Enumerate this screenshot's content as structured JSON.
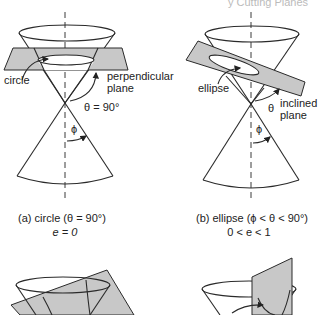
{
  "header": {
    "partial_title": "y Cutting Planes"
  },
  "panels": [
    {
      "id": "a",
      "labels": {
        "section": "circle",
        "plane": [
          "perpendicular",
          "plane"
        ],
        "angle": "θ = 90°",
        "half_angle": "ϕ"
      },
      "caption": {
        "line1": "(a) circle (θ = 90°)",
        "line2": "e = 0"
      }
    },
    {
      "id": "b",
      "labels": {
        "section": "ellipse",
        "plane": [
          "inclined",
          "plane"
        ],
        "angle": "θ",
        "half_angle": "ϕ"
      },
      "caption": {
        "line1": "(b) ellipse (ϕ < θ < 90°)",
        "line2": "0 < e < 1"
      }
    },
    {
      "id": "c",
      "labels": {},
      "caption": {}
    },
    {
      "id": "d",
      "labels": {},
      "caption": {}
    }
  ]
}
